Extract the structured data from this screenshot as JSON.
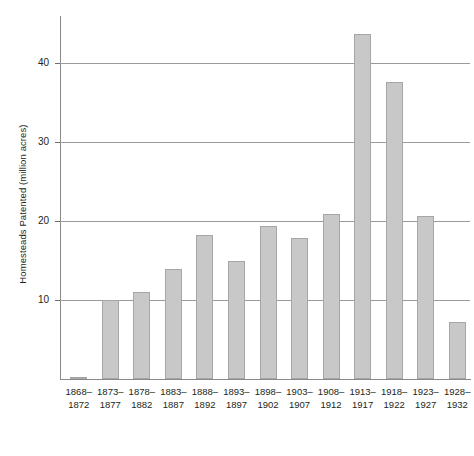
{
  "chart_data": {
    "type": "bar",
    "title": "",
    "xlabel": "",
    "ylabel": "Homesteads Patented (million acres)",
    "categories": [
      "1868–\n1872",
      "1873–\n1877",
      "1878–\n1882",
      "1883–\n1887",
      "1888–\n1892",
      "1893–\n1897",
      "1898–\n1902",
      "1903–\n1907",
      "1908–\n1912",
      "1913–\n1917",
      "1918–\n1922",
      "1923–\n1927",
      "1928–\n1932"
    ],
    "categories_lines": [
      [
        "1868–",
        "1872"
      ],
      [
        "1873–",
        "1877"
      ],
      [
        "1878–",
        "1882"
      ],
      [
        "1883–",
        "1887"
      ],
      [
        "1888–",
        "1892"
      ],
      [
        "1893–",
        "1897"
      ],
      [
        "1898–",
        "1902"
      ],
      [
        "1903–",
        "1907"
      ],
      [
        "1908–",
        "1912"
      ],
      [
        "1913–",
        "1917"
      ],
      [
        "1918–",
        "1922"
      ],
      [
        "1923–",
        "1927"
      ],
      [
        "1928–",
        "1932"
      ]
    ],
    "values": [
      0.3,
      10.0,
      11.0,
      14.0,
      18.2,
      15.0,
      19.4,
      17.9,
      20.9,
      43.7,
      37.7,
      20.6,
      7.2
    ],
    "ylim": [
      0,
      46
    ],
    "yticks": [
      10,
      20,
      30,
      40
    ],
    "ytick_labels": [
      "10",
      "20",
      "30",
      "40"
    ],
    "grid": true,
    "legend": "none",
    "bar_fill_color": "#c8c8c8",
    "bar_border_color": "#a6a6a6",
    "axis_color": "#8a8a8a",
    "grid_color": "#9a9a9a",
    "text_color": "#231f20"
  }
}
